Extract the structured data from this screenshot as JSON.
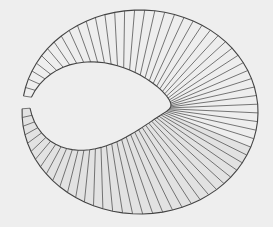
{
  "figure": {
    "background_color": "#eeeeee",
    "line_color": "#555555",
    "edge_color": "#444444",
    "shade_color": "#d6d6d6",
    "ruling_count": 72
  }
}
